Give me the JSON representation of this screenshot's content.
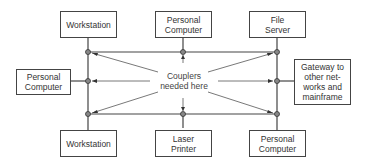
{
  "diagram": {
    "type": "network-topology",
    "center_label": "Couplers needed here",
    "nodes": [
      {
        "id": "ws-top",
        "label": "Workstation"
      },
      {
        "id": "pc-top",
        "label": "Personal Computer"
      },
      {
        "id": "file-server",
        "label": "File Server"
      },
      {
        "id": "pc-left",
        "label": "Personal Computer"
      },
      {
        "id": "gateway",
        "label": "Gateway to other net-works and mainframe"
      },
      {
        "id": "ws-bottom",
        "label": "Workstation"
      },
      {
        "id": "laser-printer",
        "label": "Laser Printer"
      },
      {
        "id": "pc-bottom",
        "label": "Personal Computer"
      }
    ],
    "labels": {
      "ws_top": "Workstation",
      "pc_top_1": "Personal",
      "pc_top_2": "Computer",
      "fs_1": "File",
      "fs_2": "Server",
      "pc_left_1": "Personal",
      "pc_left_2": "Computer",
      "gw_1": "Gateway to",
      "gw_2": "other net-",
      "gw_3": "works and",
      "gw_4": "mainframe",
      "ws_bottom": "Workstation",
      "lp_1": "Laser",
      "lp_2": "Printer",
      "pc_bottom_1": "Personal",
      "pc_bottom_2": "Computer",
      "center_1": "Couplers",
      "center_2": "needed here"
    },
    "colors": {
      "line": "#444444",
      "coupler": "#555555"
    }
  }
}
